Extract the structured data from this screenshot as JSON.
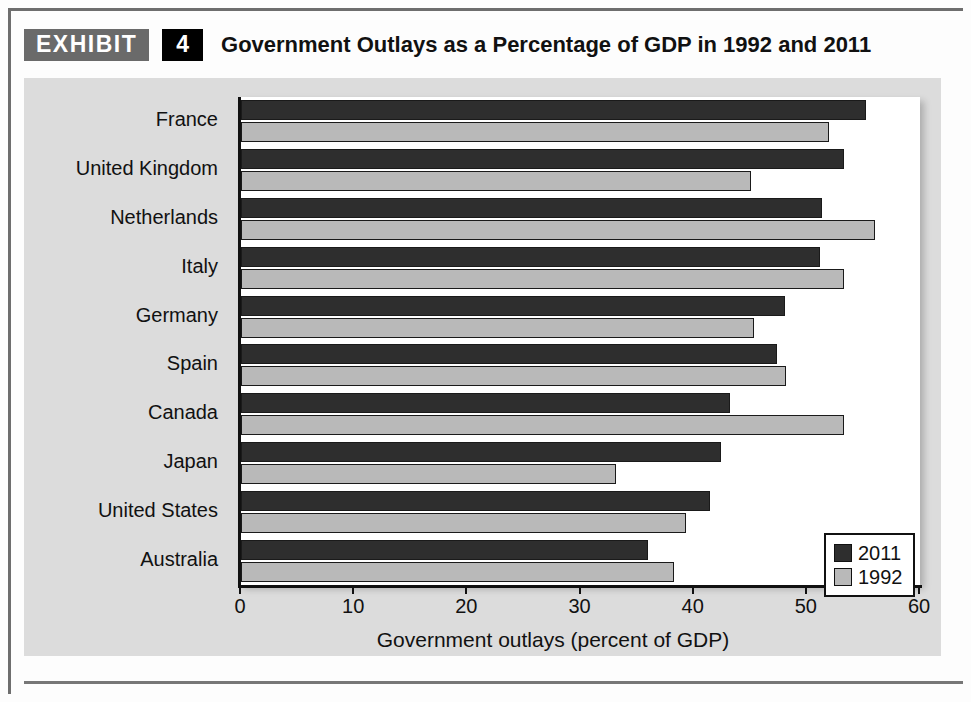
{
  "header": {
    "exhibit_label": "EXHIBIT",
    "exhibit_number": "4",
    "title": "Government Outlays as a Percentage of GDP in 1992 and 2011"
  },
  "colors": {
    "series_2011": "#2e2e2e",
    "series_1992": "#b9b9b9",
    "panel_background": "#dcdcdc",
    "plot_background": "#ffffff",
    "exhibit_tag_background": "#6a6a6a",
    "exhibit_number_background": "#000000"
  },
  "chart_data": {
    "type": "bar",
    "orientation": "horizontal",
    "title": "Government Outlays as a Percentage of GDP in 1992 and 2011",
    "xlabel": "Government outlays (percent of GDP)",
    "ylabel": "",
    "xlim": [
      0,
      60
    ],
    "xticks": [
      0,
      10,
      20,
      30,
      40,
      50,
      60
    ],
    "xtick_labels": [
      "0",
      "10",
      "20",
      "30",
      "40",
      "50",
      "60"
    ],
    "grid": false,
    "legend_position": "inside-lower-right",
    "categories": [
      "France",
      "United Kingdom",
      "Netherlands",
      "Italy",
      "Germany",
      "Spain",
      "Canada",
      "Japan",
      "United States",
      "Australia"
    ],
    "series": [
      {
        "name": "2011",
        "color": "#2e2e2e",
        "values": [
          55.2,
          53.3,
          51.3,
          51.2,
          48.1,
          47.4,
          43.2,
          42.4,
          41.4,
          36.0
        ]
      },
      {
        "name": "1992",
        "color": "#b9b9b9",
        "values": [
          52.0,
          45.1,
          56.0,
          53.3,
          45.3,
          48.2,
          53.3,
          33.1,
          39.3,
          38.3
        ]
      }
    ]
  }
}
